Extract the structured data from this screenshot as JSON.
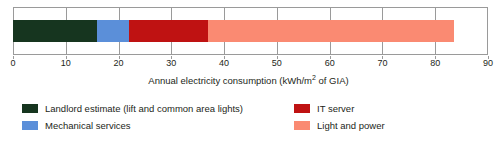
{
  "chart_data": {
    "type": "bar",
    "orientation": "horizontal",
    "stacked": true,
    "title": "",
    "xlabel": "Annual electricity consumption (kWh/m2 of GIA)",
    "ylabel": "",
    "xlim": [
      0,
      90
    ],
    "xticks": [
      0,
      10,
      20,
      30,
      40,
      50,
      60,
      70,
      80,
      90
    ],
    "xtick_labels": [
      "0",
      "10",
      "20",
      "30",
      "40",
      "50",
      "60",
      "70",
      "80",
      "90"
    ],
    "grid": true,
    "legend_position": "bottom",
    "categories": [
      ""
    ],
    "series": [
      {
        "name": "Landlord estimate (lift and common area lights)",
        "values": [
          16
        ],
        "color": "#16351f",
        "start": 0,
        "end": 16
      },
      {
        "name": "Mechanical services",
        "values": [
          6
        ],
        "color": "#5b8fd9",
        "start": 16,
        "end": 22
      },
      {
        "name": "IT server",
        "values": [
          15
        ],
        "color": "#bf1212",
        "start": 22,
        "end": 37
      },
      {
        "name": "Light and power",
        "values": [
          46.5
        ],
        "color": "#fa8a72",
        "start": 37,
        "end": 83.5
      }
    ],
    "total": 83.5
  },
  "axis": {
    "title_main": "Annual electricity consumption (kWh/m",
    "title_sup": "2",
    "title_tail": " of GIA)"
  },
  "legend": {
    "left_items": [
      {
        "label": "Landlord estimate (lift and common area lights)",
        "color": "#16351f"
      },
      {
        "label": "Mechanical services",
        "color": "#5b8fd9"
      }
    ],
    "right_items": [
      {
        "label": "IT server",
        "color": "#bf1212"
      },
      {
        "label": "Light and power",
        "color": "#fa8a72"
      }
    ]
  },
  "caption": {
    "cut_off_text": ""
  }
}
